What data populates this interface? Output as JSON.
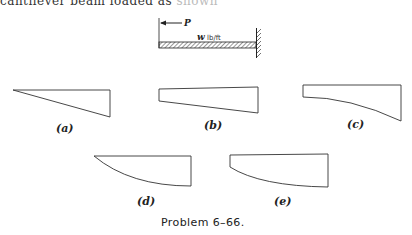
{
  "header_text": {
    "visible": "cantilever beam loaded as",
    "faded": " shown"
  },
  "beam_figure": {
    "force_label": "P",
    "load_symbol": "w",
    "load_units": "lb/ft"
  },
  "options": [
    {
      "label": "(a)",
      "shape": "triangle-linear"
    },
    {
      "label": "(b)",
      "shape": "trapezoid-linear"
    },
    {
      "label": "(c)",
      "shape": "trapezoid-parabolic"
    },
    {
      "label": "(d)",
      "shape": "triangle-parabolic"
    },
    {
      "label": "(e)",
      "shape": "trapezoid-parabolic-convex"
    }
  ],
  "caption": "Problem 6–66."
}
